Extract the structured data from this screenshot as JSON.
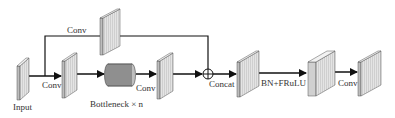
{
  "diagram": {
    "type": "network-architecture",
    "labels": {
      "input": "Input",
      "conv_input": "Conv",
      "conv_top": "Conv",
      "bottleneck": "Bottleneck × n",
      "conv_after_bottleneck": "Conv",
      "concat": "Concat",
      "bn_act": "BN+FRuLU",
      "conv_final": "Conv"
    },
    "colors": {
      "block_face": "#d9d9d9",
      "block_side": "#f0f0f0",
      "cylinder": "#8c8c8c",
      "line": "#111111",
      "text": "#333333"
    }
  }
}
